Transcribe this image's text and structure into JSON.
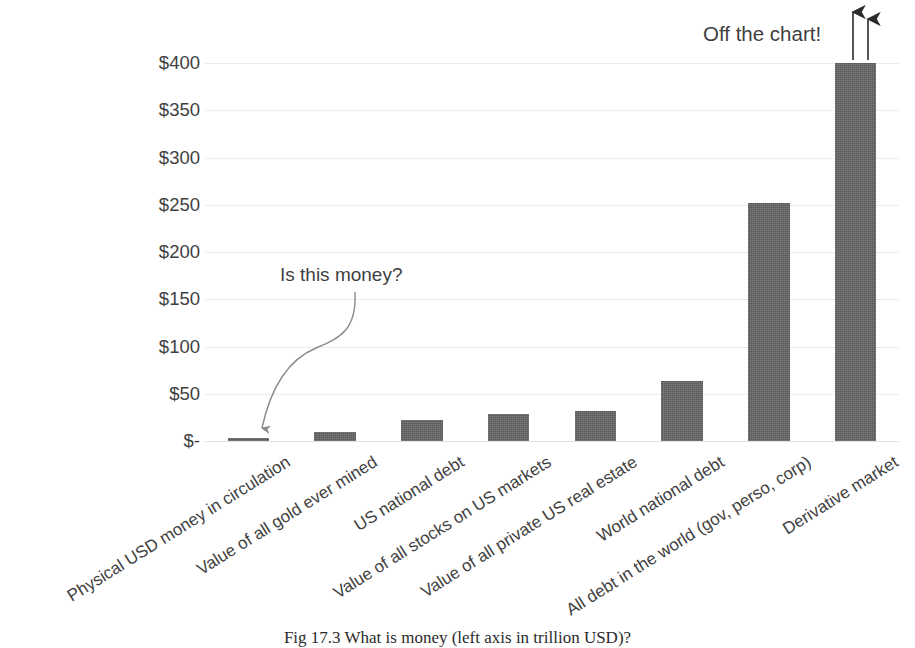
{
  "chart_data": {
    "type": "bar",
    "title": "",
    "xlabel": "",
    "ylabel": "",
    "ylim": [
      0,
      400
    ],
    "grid": true,
    "legend": "none",
    "y_tick_labels": [
      "$400",
      "$350",
      "$300",
      "$250",
      "$200",
      "$150",
      "$100",
      "$50",
      "$-"
    ],
    "y_tick_values": [
      400,
      350,
      300,
      250,
      200,
      150,
      100,
      50,
      0
    ],
    "units": "trillion USD",
    "categories": [
      "Physical USD money in circulation",
      "Value of all gold ever mined",
      "US national debt",
      "Value of all stocks on US markets",
      "Value of all private US real estate",
      "World national debt",
      "All debt in the world (gov, perso, corp)",
      "Derivative market"
    ],
    "values": [
      1.5,
      10,
      22,
      29,
      32,
      63,
      252,
      400
    ],
    "annotations": [
      {
        "text": "Is this money?",
        "target_category": "Physical USD money in circulation",
        "style": "curved-arrow"
      },
      {
        "text": "Off the chart!",
        "target_category": "Derivative market",
        "style": "up-arrows",
        "note": "Derivative market bar exceeds the $400 axis maximum"
      }
    ]
  },
  "caption": {
    "text": "Fig 17.3 What is money (left axis in trillion USD)?"
  },
  "colors": {
    "bar_fill": "#595959",
    "gridline": "#ececed",
    "text": "#3f3f3f",
    "background": "#ffffff"
  }
}
